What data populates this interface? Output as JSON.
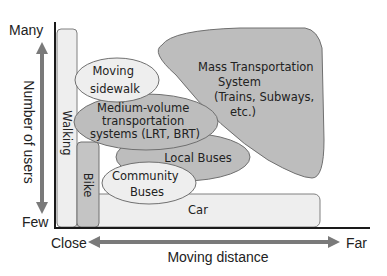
{
  "diagram": {
    "y_axis": {
      "label": "Number of users",
      "top": "Many",
      "bottom": "Few"
    },
    "x_axis": {
      "label": "Moving distance",
      "left": "Close",
      "right": "Far"
    },
    "modes": {
      "walking": "Walking",
      "bike": "Bike",
      "car": "Car",
      "moving_sidewalk": [
        "Moving",
        "sidewalk"
      ],
      "medium_volume": [
        "Medium-volume",
        "transportation",
        "systems (LRT, BRT)"
      ],
      "local_buses": "Local Buses",
      "community_buses": [
        "Community",
        "Buses"
      ],
      "mass_transport": [
        "Mass Transportation",
        "System",
        "(Trains, Subways,",
        "etc.)"
      ]
    },
    "colors": {
      "light_fill": "#eeeeee",
      "dark_fill": "#bdbdbd",
      "stroke": "#707070",
      "arrow": "#7a7a7a",
      "axis": "#1a1a1a"
    }
  }
}
